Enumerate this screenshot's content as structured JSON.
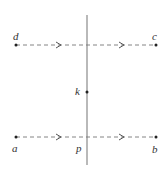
{
  "diagram": {
    "colors": {
      "line": "#888888",
      "dashed": "#777777",
      "point": "#222222",
      "label": "#333333"
    },
    "vertical_line": {
      "x": 87,
      "y1": 15,
      "y2": 165
    },
    "top_path": {
      "from": "d",
      "to": "c",
      "y": 45,
      "x1": 16,
      "x2": 156,
      "arrows_at": [
        60,
        123
      ],
      "direction": "right"
    },
    "bottom_path": {
      "from": "a",
      "to": "b",
      "y": 137,
      "x1": 16,
      "x2": 156,
      "arrows_at": [
        60,
        123
      ],
      "direction": "right"
    },
    "points": {
      "d": {
        "label": "d",
        "x": 16,
        "y": 45
      },
      "c": {
        "label": "c",
        "x": 156,
        "y": 45
      },
      "k": {
        "label": "k",
        "x": 87,
        "y": 92
      },
      "a": {
        "label": "a",
        "x": 16,
        "y": 137
      },
      "b": {
        "label": "b",
        "x": 156,
        "y": 137
      },
      "p": {
        "label": "p",
        "x": 87,
        "y": 137
      }
    }
  }
}
